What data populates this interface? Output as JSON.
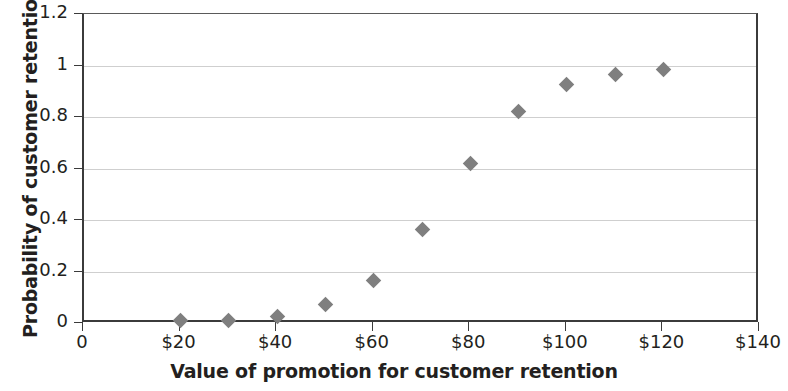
{
  "chart_data": {
    "type": "scatter",
    "title": "",
    "xlabel": "Value of promotion for customer retention",
    "ylabel": "Probability of customer retention",
    "xlim": [
      0,
      140
    ],
    "ylim": [
      0,
      1.2
    ],
    "grid": true,
    "legend": "none",
    "marker": "diamond",
    "marker_color": "#7f7f7f",
    "x_tick_labels": [
      "0",
      "$20",
      "$40",
      "$60",
      "$80",
      "$100",
      "$120",
      "$140"
    ],
    "x_tick_values": [
      0,
      20,
      40,
      60,
      80,
      100,
      120,
      140
    ],
    "y_tick_labels": [
      "0",
      "0.2",
      "0.4",
      "0.6",
      "0.8",
      "1",
      "1.2"
    ],
    "y_tick_values": [
      0,
      0.2,
      0.4,
      0.6,
      0.8,
      1,
      1.2
    ],
    "x": [
      20,
      30,
      40,
      50,
      60,
      70,
      80,
      90,
      100,
      110,
      120
    ],
    "values": [
      0.01,
      0.008,
      0.025,
      0.07,
      0.165,
      0.365,
      0.62,
      0.82,
      0.925,
      0.965,
      0.985
    ],
    "points": [
      {
        "x": 20,
        "y": 0.01
      },
      {
        "x": 30,
        "y": 0.008
      },
      {
        "x": 40,
        "y": 0.025
      },
      {
        "x": 50,
        "y": 0.07
      },
      {
        "x": 60,
        "y": 0.165
      },
      {
        "x": 70,
        "y": 0.365
      },
      {
        "x": 80,
        "y": 0.62
      },
      {
        "x": 90,
        "y": 0.82
      },
      {
        "x": 100,
        "y": 0.925
      },
      {
        "x": 110,
        "y": 0.965
      },
      {
        "x": 120,
        "y": 0.985
      }
    ]
  },
  "colors": {
    "marker": "#7f7f7f",
    "axis": "#3b3b3b",
    "grid": "#cfcfcf",
    "text": "#231f20",
    "background": "#ffffff"
  }
}
